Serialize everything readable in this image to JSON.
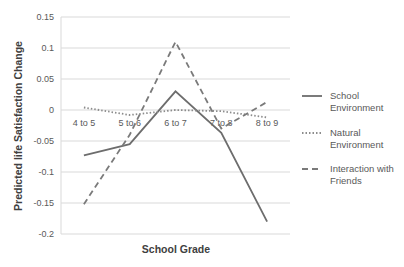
{
  "chart_data": {
    "type": "line",
    "title": "",
    "xlabel": "School Grade",
    "ylabel": "Predicted life Satisfaction Change",
    "categories": [
      "4 to 5",
      "5 to 6",
      "6 to 7",
      "7 to 8",
      "8 to 9"
    ],
    "ylim": [
      -0.2,
      0.15
    ],
    "yticks": [
      0.15,
      0.1,
      0.05,
      0,
      -0.05,
      -0.1,
      -0.15,
      -0.2
    ],
    "ytick_labels": [
      "0.15",
      "0.1",
      "0.05",
      "0",
      "-0.05",
      "-0.1",
      "-0.15",
      "-0.2"
    ],
    "grid": true,
    "legend_position": "right",
    "series": [
      {
        "name": "School Environment",
        "style": "solid",
        "color": "#6d6d6d",
        "values": [
          -0.073,
          -0.055,
          0.03,
          -0.037,
          -0.18
        ]
      },
      {
        "name": "Natural Environment",
        "style": "dotted",
        "color": "#8c8c8c",
        "values": [
          0.004,
          -0.008,
          0.0,
          -0.002,
          -0.012
        ]
      },
      {
        "name": "Interaction with Friends",
        "style": "dashed",
        "color": "#7a7a7a",
        "values": [
          -0.152,
          -0.04,
          0.11,
          -0.03,
          0.013
        ]
      }
    ]
  },
  "legend": {
    "items": [
      {
        "line1": "School",
        "line2": "Environment"
      },
      {
        "line1": "Natural",
        "line2": "Environment"
      },
      {
        "line1": "Interaction with",
        "line2": "Friends"
      }
    ]
  },
  "colors": {
    "grid": "#d9d9d9",
    "text": "#595959"
  }
}
